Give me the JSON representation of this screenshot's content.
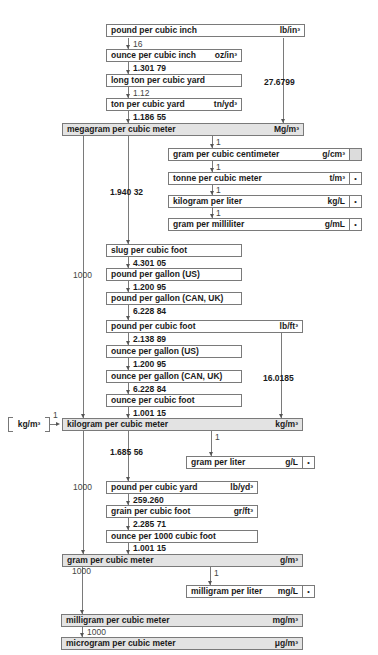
{
  "diagram": {
    "units": {
      "pound_per_cubic_inch": {
        "name": "pound per cubic inch",
        "symbol": "lb/in³"
      },
      "ounce_per_cubic_inch": {
        "name": "ounce per cubic inch",
        "symbol": "oz/in³"
      },
      "long_ton_per_cubic_yard": {
        "name": "long ton per cubic yard",
        "symbol": ""
      },
      "ton_per_cubic_yard": {
        "name": "ton per cubic yard",
        "symbol": "tn/yd³"
      },
      "megagram_per_cubic_meter": {
        "name": "megagram per cubic meter",
        "symbol": "Mg/m³"
      },
      "gram_per_cubic_centimeter": {
        "name": "gram per cubic centimeter",
        "symbol": "g/cm³"
      },
      "tonne_per_cubic_meter": {
        "name": "tonne per cubic meter",
        "symbol": "t/m³",
        "marker": "•"
      },
      "kilogram_per_liter": {
        "name": "kilogram per liter",
        "symbol": "kg/L",
        "marker": "•"
      },
      "gram_per_milliliter": {
        "name": "gram per milliliter",
        "symbol": "g/mL",
        "marker": "•"
      },
      "slug_per_cubic_foot": {
        "name": "slug per cubic foot",
        "symbol": ""
      },
      "pound_per_gallon_us": {
        "name": "pound per gallon (US)",
        "symbol": ""
      },
      "pound_per_gallon_can_uk": {
        "name": "pound per gallon (CAN, UK)",
        "symbol": ""
      },
      "pound_per_cubic_foot": {
        "name": "pound per cubic foot",
        "symbol": "lb/ft³"
      },
      "ounce_per_gallon_us": {
        "name": "ounce per gallon (US)",
        "symbol": ""
      },
      "ounce_per_gallon_can_uk": {
        "name": "ounce per gallon (CAN, UK)",
        "symbol": ""
      },
      "ounce_per_cubic_foot": {
        "name": "ounce per cubic foot",
        "symbol": ""
      },
      "kilogram_per_cubic_meter": {
        "name": "kilogram per cubic meter",
        "symbol": "kg/m³"
      },
      "gram_per_liter": {
        "name": "gram per liter",
        "symbol": "g/L",
        "marker": "•"
      },
      "pound_per_cubic_yard": {
        "name": "pound per cubic yard",
        "symbol": "lb/yd³"
      },
      "grain_per_cubic_foot": {
        "name": "grain per cubic foot",
        "symbol": "gr/ft³"
      },
      "ounce_per_1000_cubic_foot": {
        "name": "ounce per 1000 cubic foot",
        "symbol": ""
      },
      "gram_per_cubic_meter": {
        "name": "gram per cubic meter",
        "symbol": "g/m³"
      },
      "milligram_per_liter": {
        "name": "milligram per liter",
        "symbol": "mg/L",
        "marker": "•"
      },
      "milligram_per_cubic_meter": {
        "name": "milligram per cubic meter",
        "symbol": "mg/m³"
      },
      "microgram_per_cubic_meter": {
        "name": "microgram per cubic meter",
        "symbol": "μg/m³"
      }
    },
    "base_unit_label": "kg/m³",
    "base_unit_factor": "1",
    "factors": {
      "lbin3_to_ozin3": "16",
      "ozin3_to_longton": "1.301 79",
      "longton_to_ton": "1.12",
      "ton_to_mg": "1.186 55",
      "lbin3_to_mg": "27.6799",
      "mg_to_gcm3": "1",
      "gcm3_to_tm3": "1",
      "tm3_to_kgl": "1",
      "kgl_to_gml": "1",
      "mg_to_slug": "1.940 32",
      "mg_to_kgm3": "1000",
      "slug_to_lbgal_us": "4.301 05",
      "lbgal_us_to_can": "1.200 95",
      "lbgal_can_to_lbft3": "6.228 84",
      "lbft3_to_ozgal_us": "2.138 89",
      "ozgal_us_to_can": "1.200 95",
      "ozgal_can_to_ozft3": "6.228 84",
      "ozft3_to_kgm3": "1.001 15",
      "lbft3_to_kgm3": "16.0185",
      "kgm3_to_gl": "1",
      "kgm3_to_lbyd3": "1.685 56",
      "kgm3_to_gm3": "1000",
      "lbyd3_to_grft3": "259.260",
      "grft3_to_oz1000": "2.285 71",
      "oz1000_to_gm3": "1.001 15",
      "gm3_to_mgl": "1",
      "gm3_to_mgm3": "1000",
      "mgm3_to_ugm3": "1000"
    }
  }
}
